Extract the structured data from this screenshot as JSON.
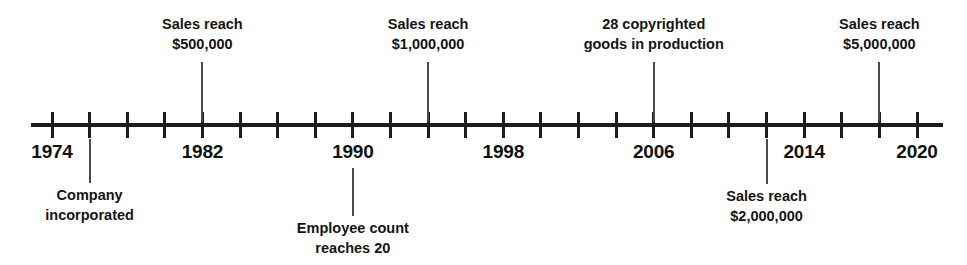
{
  "figure": {
    "background_color": "#ffffff",
    "line_color": "#1c1c1c",
    "text_color": "#141414",
    "connector_color": "#4a4a4a"
  },
  "axis": {
    "start_year": 1974,
    "end_year": 2020,
    "tick_interval_years": 2,
    "label_interval_years": 8,
    "ticks": [
      1974,
      1976,
      1978,
      1980,
      1982,
      1984,
      1986,
      1988,
      1990,
      1992,
      1994,
      1996,
      1998,
      2000,
      2002,
      2004,
      2006,
      2008,
      2010,
      2012,
      2014,
      2016,
      2018,
      2020
    ],
    "year_labels": [
      {
        "year": 1974,
        "text": "1974"
      },
      {
        "year": 1982,
        "text": "1982"
      },
      {
        "year": 1990,
        "text": "1990"
      },
      {
        "year": 1998,
        "text": "1998"
      },
      {
        "year": 2006,
        "text": "2006"
      },
      {
        "year": 2014,
        "text": "2014"
      },
      {
        "year": 2020,
        "text": "2020"
      }
    ]
  },
  "annotations": [
    {
      "id": "sales-500k",
      "year": 1982,
      "side": "above",
      "line1": "Sales reach",
      "line2": "$500,000"
    },
    {
      "id": "sales-1m",
      "year": 1994,
      "side": "above",
      "line1": "Sales reach",
      "line2": "$1,000,000"
    },
    {
      "id": "copyrighted-goods",
      "year": 2006,
      "side": "above",
      "line1": "28 copyrighted",
      "line2": "goods in production"
    },
    {
      "id": "sales-5m",
      "year": 2018,
      "side": "above",
      "line1": "Sales reach",
      "line2": "$5,000,000"
    },
    {
      "id": "company-incorporated",
      "year": 1976,
      "side": "below",
      "line1": "Company",
      "line2": "incorporated"
    },
    {
      "id": "employee-count",
      "year": 1990,
      "side": "below",
      "line1": "Employee count",
      "line2": "reaches 20"
    },
    {
      "id": "sales-2m",
      "year": 2012,
      "side": "below",
      "line1": "Sales reach",
      "line2": "$2,000,000"
    }
  ],
  "chart_data": {
    "type": "timeline",
    "xlabel": "",
    "ylabel": "",
    "xlim": [
      1974,
      2020
    ],
    "grid": false,
    "legend": "none",
    "axis_tick_years": [
      1974,
      1976,
      1978,
      1980,
      1982,
      1984,
      1986,
      1988,
      1990,
      1992,
      1994,
      1996,
      1998,
      2000,
      2002,
      2004,
      2006,
      2008,
      2010,
      2012,
      2014,
      2016,
      2018,
      2020
    ],
    "axis_tick_labels": [
      "1974",
      "1982",
      "1990",
      "1998",
      "2006",
      "2014",
      "2020"
    ],
    "events": [
      {
        "year": 1976,
        "label": "Company incorporated",
        "position": "below"
      },
      {
        "year": 1982,
        "label": "Sales reach $500,000",
        "position": "above",
        "value": 500000
      },
      {
        "year": 1990,
        "label": "Employee count reaches 20",
        "position": "below",
        "value": 20
      },
      {
        "year": 1994,
        "label": "Sales reach $1,000,000",
        "position": "above",
        "value": 1000000
      },
      {
        "year": 2006,
        "label": "28 copyrighted goods in production",
        "position": "above",
        "value": 28
      },
      {
        "year": 2012,
        "label": "Sales reach $2,000,000",
        "position": "below",
        "value": 2000000
      },
      {
        "year": 2018,
        "label": "Sales reach $5,000,000",
        "position": "above",
        "value": 5000000
      }
    ]
  }
}
